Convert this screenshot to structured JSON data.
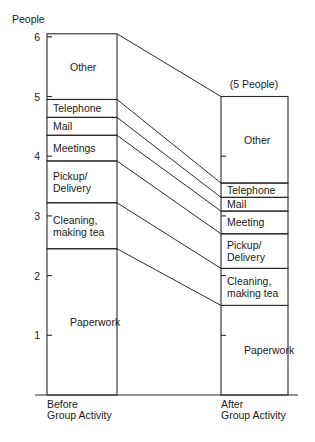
{
  "chart_data": {
    "type": "bar",
    "subtype": "stacked-bar-with-connectors",
    "title": "",
    "ylabel": "People",
    "xlabel": "",
    "ylim": [
      0,
      6.2
    ],
    "yticks": [
      1,
      2,
      3,
      4,
      5,
      6
    ],
    "grid": false,
    "legend": "none (segment labels inside bars)",
    "categories": [
      "Before Group Activity",
      "After Group Activity"
    ],
    "category_labels": [
      [
        "Before",
        "Group Activity"
      ],
      [
        "After",
        "Group Activity"
      ]
    ],
    "annotations": [
      {
        "text": "(5 People)",
        "target": "After Group Activity",
        "position": "above bar"
      }
    ],
    "series": [
      {
        "name": "Paperwork",
        "labels": [
          [
            "Paperwork"
          ],
          [
            "Paperwork"
          ]
        ],
        "values": [
          2.45,
          1.5
        ]
      },
      {
        "name": "Cleaning, making tea",
        "labels": [
          [
            "Cleaning,",
            "making tea"
          ],
          [
            "Cleaning,",
            "making tea"
          ]
        ],
        "values": [
          0.77,
          0.62
        ]
      },
      {
        "name": "Pickup/Delivery",
        "labels": [
          [
            "Pickup/",
            "Delivery"
          ],
          [
            "Pickup/",
            "Delivery"
          ]
        ],
        "values": [
          0.7,
          0.58
        ]
      },
      {
        "name": "Meetings",
        "labels": [
          [
            "Meetings"
          ],
          [
            "Meeting"
          ]
        ],
        "values": [
          0.43,
          0.38
        ]
      },
      {
        "name": "Mail",
        "labels": [
          [
            "Mail"
          ],
          [
            "Mail"
          ]
        ],
        "values": [
          0.3,
          0.23
        ]
      },
      {
        "name": "Telephone",
        "labels": [
          [
            "Telephone"
          ],
          [
            "Telephone"
          ]
        ],
        "values": [
          0.3,
          0.24
        ]
      },
      {
        "name": "Other",
        "labels": [
          [
            "Other"
          ],
          [
            "Other"
          ]
        ],
        "values": [
          1.1,
          1.45
        ]
      }
    ],
    "totals": [
      6.05,
      5.0
    ]
  },
  "axis": {
    "y_title": "People",
    "tick_labels": [
      "1",
      "2",
      "3",
      "4",
      "5",
      "6"
    ]
  },
  "annotation_after": "(5 People)"
}
